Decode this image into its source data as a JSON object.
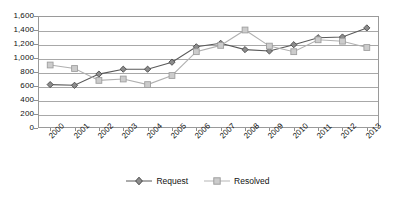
{
  "chart_data": {
    "type": "line",
    "title": "",
    "subtitle": "",
    "xlabel": "",
    "ylabel": "",
    "categories": [
      "2000",
      "2001",
      "2002",
      "2003",
      "2004",
      "2005",
      "2006",
      "2007",
      "2008",
      "2009",
      "2010",
      "2011",
      "2012",
      "2013"
    ],
    "series": [
      {
        "name": "Request",
        "color": "#595959",
        "marker": "diamond",
        "values": [
          620,
          610,
          770,
          840,
          840,
          940,
          1160,
          1210,
          1120,
          1100,
          1190,
          1290,
          1300,
          1430
        ]
      },
      {
        "name": "Resolved",
        "color": "#b0b0b0",
        "marker": "square",
        "values": [
          900,
          850,
          680,
          700,
          620,
          750,
          1090,
          1180,
          1400,
          1170,
          1090,
          1260,
          1240,
          1150
        ]
      }
    ],
    "ylim": [
      0,
      1600
    ],
    "yticks": [
      0,
      200,
      400,
      600,
      800,
      1000,
      1200,
      1400,
      1600
    ],
    "ytick_labels": [
      "0",
      "200",
      "400",
      "600",
      "800",
      "1,000",
      "1,200",
      "1,400",
      "1,600"
    ],
    "grid": true,
    "legend_position": "bottom",
    "xtick_rotation": -45
  },
  "legend": {
    "items": [
      {
        "label": "Request"
      },
      {
        "label": "Resolved"
      }
    ]
  },
  "colors": {
    "request": "#595959",
    "resolved": "#b0b0b0",
    "grid": "#a8a8a8",
    "axis": "#9a9a9a",
    "text": "#111111",
    "background": "#ffffff"
  }
}
